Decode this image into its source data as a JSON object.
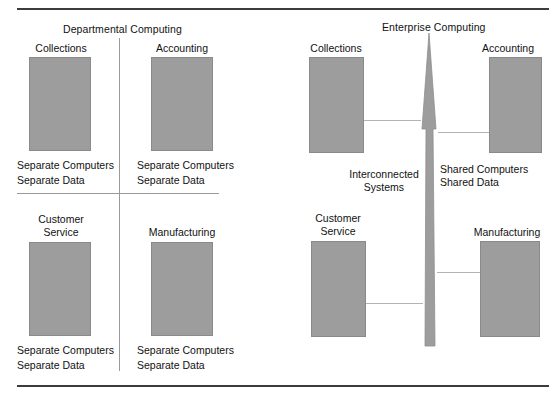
{
  "figure": {
    "width": 557,
    "height": 399,
    "box_fill": "#9d9d9d",
    "box_stroke": "#8a8a8a",
    "rule_color": "#3c3c3c",
    "divider_color": "#9a9a9a",
    "connector_color": "#b4b4b4",
    "arrow_fill": "#9d9d9d"
  },
  "left_panel": {
    "title": "Departmental Computing",
    "quadrants": [
      {
        "label": "Collections",
        "caption": "Separate Computers\nSeparate Data"
      },
      {
        "label": "Accounting",
        "caption": "Separate Computers\nSeparate Data"
      },
      {
        "label": "Customer\nService",
        "caption": "Separate Computers\nSeparate Data"
      },
      {
        "label": "Manufacturing",
        "caption": "Separate Computers\nSeparate Data"
      }
    ]
  },
  "right_panel": {
    "title": "Enterprise Computing",
    "nodes": [
      {
        "label": "Collections"
      },
      {
        "label": "Accounting"
      },
      {
        "label": "Customer\nService"
      },
      {
        "label": "Manufacturing"
      }
    ],
    "annotations": [
      {
        "text": "Interconnected\nSystems"
      },
      {
        "text": "Shared Computers\nShared Data"
      }
    ],
    "arrow_name": "upward-arrow"
  }
}
